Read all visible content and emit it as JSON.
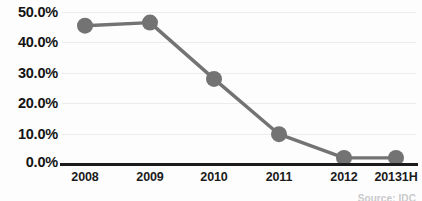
{
  "chart_data": {
    "type": "line",
    "title": "",
    "subtitle": "",
    "xlabel": "",
    "ylabel": "",
    "categories": [
      "2008",
      "2009",
      "2010",
      "2011",
      "2012",
      "20131H"
    ],
    "values": [
      45.5,
      46.5,
      28.0,
      9.8,
      2.0,
      2.0
    ],
    "series": [
      {
        "name": "Share",
        "values": [
          45.5,
          46.5,
          28.0,
          9.8,
          2.0,
          2.0
        ]
      }
    ],
    "ylim": [
      0.0,
      50.0
    ],
    "ytick_labels": [
      "50.0%",
      "40.0%",
      "30.0%",
      "20.0%",
      "10.0%",
      "0.0%"
    ],
    "ytick_values": [
      50,
      40,
      30,
      20,
      10,
      0
    ],
    "grid": true,
    "legend": "none",
    "annotations": {
      "source": "Source: IDC"
    },
    "colors": {
      "line": "#737373",
      "marker": "#737373",
      "gridline": "#ececed",
      "axis": "#1b1b1b",
      "text": "#141414",
      "source_text": "#c9c9cb",
      "background": "#fdfdfd"
    }
  }
}
